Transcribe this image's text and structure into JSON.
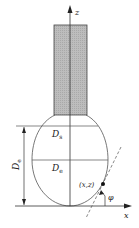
{
  "diagram": {
    "title": "",
    "axes": {
      "z_label": "z",
      "x_label": "x"
    },
    "labels": {
      "ds": {
        "main": "D",
        "sub": "s"
      },
      "de_inner": {
        "main": "D",
        "sub": "e"
      },
      "de_dimension": {
        "main": "D",
        "sub": "e"
      },
      "point": "(x,z)",
      "angle": "φ"
    },
    "colors": {
      "line": "#333333",
      "cylinder_fill": "#b8b8b8",
      "background": "#ffffff"
    }
  }
}
